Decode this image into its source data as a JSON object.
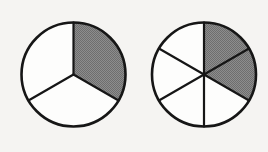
{
  "figure": {
    "background_color": "#f5f4f2",
    "line_color": "#161616",
    "shaded_color": "#808080",
    "unshaded_color": "#fdfdfc",
    "outline_width": 2.6,
    "spoke_width": 2.2,
    "circles": [
      {
        "name": "circle-thirds",
        "label": "one third shaded",
        "center_x": 73.5,
        "center_y": 74.5,
        "radius": 52,
        "total_sectors": 3,
        "shaded_sectors": 1,
        "sector_angle_deg": 120,
        "start_angle_deg": 0,
        "shaded_start_deg": 0,
        "shaded_end_deg": 120,
        "fraction": "1/3",
        "spoke_angles_deg": [
          0,
          120,
          240
        ]
      },
      {
        "name": "circle-sixths",
        "label": "two sixths shaded",
        "center_x": 204,
        "center_y": 74.5,
        "radius": 52,
        "total_sectors": 6,
        "shaded_sectors": 2,
        "sector_angle_deg": 60,
        "start_angle_deg": 0,
        "shaded_start_deg": 0,
        "shaded_end_deg": 120,
        "fraction": "2/6",
        "spoke_angles_deg": [
          0,
          60,
          120,
          180,
          240,
          300
        ]
      }
    ]
  },
  "chart_data": {
    "type": "pie",
    "xlabel": "",
    "ylabel": "",
    "legend_position": "none",
    "grid": false,
    "charts": [
      {
        "name": "circle-thirds",
        "categories": [
          "shaded",
          "unshaded",
          "unshaded"
        ],
        "values": [
          120,
          120,
          120
        ],
        "colors": [
          "#808080",
          "#fdfdfc",
          "#fdfdfc"
        ],
        "shaded_count": 1,
        "slice_count": 3,
        "fraction_value": 0.3333
      },
      {
        "name": "circle-sixths",
        "categories": [
          "shaded",
          "shaded",
          "unshaded",
          "unshaded",
          "unshaded",
          "unshaded"
        ],
        "values": [
          60,
          60,
          60,
          60,
          60,
          60
        ],
        "colors": [
          "#808080",
          "#808080",
          "#fdfdfc",
          "#fdfdfc",
          "#fdfdfc",
          "#fdfdfc"
        ],
        "shaded_count": 2,
        "slice_count": 6,
        "fraction_value": 0.3333
      }
    ]
  }
}
